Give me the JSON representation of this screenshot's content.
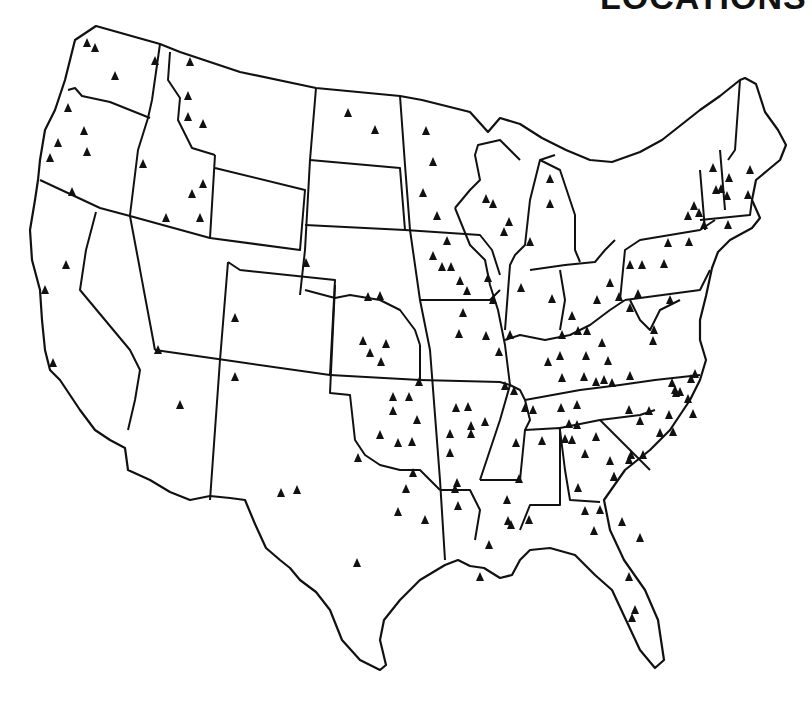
{
  "title": "LOCATIONS",
  "map": {
    "region": "Contiguous United States",
    "marker_symbol": "filled-triangle",
    "marker_color": "#111111",
    "line_color": "#111111",
    "background": "#ffffff",
    "markers": [
      [
        95,
        48
      ],
      [
        115,
        76
      ],
      [
        87,
        43
      ],
      [
        68,
        108
      ],
      [
        84,
        131
      ],
      [
        58,
        143
      ],
      [
        87,
        152
      ],
      [
        50,
        158
      ],
      [
        72,
        192
      ],
      [
        155,
        61
      ],
      [
        190,
        62
      ],
      [
        188,
        96
      ],
      [
        188,
        117
      ],
      [
        203,
        124
      ],
      [
        143,
        164
      ],
      [
        203,
        184
      ],
      [
        192,
        194
      ],
      [
        166,
        218
      ],
      [
        200,
        218
      ],
      [
        66,
        265
      ],
      [
        45,
        290
      ],
      [
        53,
        363
      ],
      [
        158,
        350
      ],
      [
        235,
        318
      ],
      [
        235,
        377
      ],
      [
        180,
        405
      ],
      [
        281,
        493
      ],
      [
        297,
        490
      ],
      [
        348,
        113
      ],
      [
        375,
        130
      ],
      [
        306,
        263
      ],
      [
        380,
        296
      ],
      [
        368,
        297
      ],
      [
        426,
        131
      ],
      [
        433,
        162
      ],
      [
        423,
        193
      ],
      [
        437,
        216
      ],
      [
        447,
        241
      ],
      [
        433,
        256
      ],
      [
        442,
        267
      ],
      [
        451,
        267
      ],
      [
        486,
        199
      ],
      [
        493,
        204
      ],
      [
        509,
        222
      ],
      [
        504,
        232
      ],
      [
        530,
        242
      ],
      [
        550,
        179
      ],
      [
        550,
        204
      ],
      [
        363,
        341
      ],
      [
        386,
        344
      ],
      [
        370,
        353
      ],
      [
        381,
        362
      ],
      [
        419,
        382
      ],
      [
        393,
        397
      ],
      [
        409,
        397
      ],
      [
        393,
        411
      ],
      [
        417,
        420
      ],
      [
        380,
        435
      ],
      [
        398,
        443
      ],
      [
        412,
        442
      ],
      [
        358,
        458
      ],
      [
        413,
        473
      ],
      [
        406,
        489
      ],
      [
        398,
        512
      ],
      [
        425,
        520
      ],
      [
        357,
        563
      ],
      [
        456,
        408
      ],
      [
        468,
        407
      ],
      [
        471,
        426
      ],
      [
        485,
        422
      ],
      [
        450,
        434
      ],
      [
        471,
        434
      ],
      [
        450,
        453
      ],
      [
        457,
        483
      ],
      [
        458,
        506
      ],
      [
        455,
        489
      ],
      [
        460,
        281
      ],
      [
        467,
        291
      ],
      [
        463,
        313
      ],
      [
        459,
        334
      ],
      [
        486,
        336
      ],
      [
        510,
        335
      ],
      [
        499,
        352
      ],
      [
        488,
        278
      ],
      [
        493,
        300
      ],
      [
        505,
        386
      ],
      [
        514,
        391
      ],
      [
        525,
        408
      ],
      [
        565,
        439
      ],
      [
        569,
        424
      ],
      [
        516,
        443
      ],
      [
        519,
        479
      ],
      [
        508,
        521
      ],
      [
        529,
        520
      ],
      [
        489,
        545
      ],
      [
        480,
        577
      ],
      [
        521,
        288
      ],
      [
        552,
        299
      ],
      [
        562,
        335
      ],
      [
        548,
        362
      ],
      [
        560,
        356
      ],
      [
        586,
        356
      ],
      [
        584,
        377
      ],
      [
        562,
        378
      ],
      [
        612,
        383
      ],
      [
        596,
        382
      ],
      [
        577,
        405
      ],
      [
        533,
        410
      ],
      [
        561,
        408
      ],
      [
        577,
        425
      ],
      [
        597,
        300
      ],
      [
        587,
        331
      ],
      [
        610,
        283
      ],
      [
        619,
        297
      ],
      [
        604,
        380
      ],
      [
        572,
        316
      ],
      [
        578,
        331
      ],
      [
        602,
        343
      ],
      [
        608,
        361
      ],
      [
        630,
        376
      ],
      [
        638,
        294
      ],
      [
        670,
        300
      ],
      [
        630,
        265
      ],
      [
        642,
        265
      ],
      [
        664,
        264
      ],
      [
        668,
        243
      ],
      [
        688,
        216
      ],
      [
        689,
        242
      ],
      [
        694,
        206
      ],
      [
        699,
        213
      ],
      [
        716,
        190
      ],
      [
        721,
        189
      ],
      [
        727,
        196
      ],
      [
        704,
        225
      ],
      [
        728,
        225
      ],
      [
        729,
        178
      ],
      [
        750,
        170
      ],
      [
        748,
        195
      ],
      [
        713,
        168
      ],
      [
        630,
        308
      ],
      [
        653,
        341
      ],
      [
        654,
        330
      ],
      [
        672,
        383
      ],
      [
        676,
        393
      ],
      [
        695,
        374
      ],
      [
        691,
        379
      ],
      [
        680,
        392
      ],
      [
        688,
        399
      ],
      [
        693,
        414
      ],
      [
        673,
        432
      ],
      [
        629,
        410
      ],
      [
        649,
        411
      ],
      [
        660,
        433
      ],
      [
        614,
        477
      ],
      [
        629,
        460
      ],
      [
        669,
        415
      ],
      [
        675,
        390
      ],
      [
        542,
        441
      ],
      [
        572,
        440
      ],
      [
        585,
        454
      ],
      [
        578,
        488
      ],
      [
        585,
        511
      ],
      [
        600,
        510
      ],
      [
        594,
        531
      ],
      [
        610,
        461
      ],
      [
        631,
        455
      ],
      [
        614,
        477
      ],
      [
        507,
        500
      ],
      [
        511,
        525
      ],
      [
        596,
        437
      ],
      [
        640,
        421
      ],
      [
        643,
        455
      ],
      [
        622,
        522
      ],
      [
        629,
        577
      ],
      [
        635,
        610
      ],
      [
        632,
        618
      ],
      [
        640,
        538
      ]
    ]
  }
}
